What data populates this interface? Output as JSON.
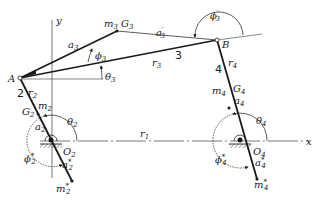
{
  "diagram": {
    "axes": {
      "x_label": "x",
      "y_label": "y"
    },
    "points": {
      "A": "A",
      "B": "B",
      "O2": {
        "base": "O",
        "sub": "2"
      },
      "O4": {
        "base": "O",
        "sub": "4"
      },
      "G2": {
        "base": "G",
        "sub": "2"
      },
      "G3": {
        "base": "G",
        "sub": "3"
      },
      "G4": {
        "base": "G",
        "sub": "4"
      }
    },
    "links": {
      "link2_number": "2",
      "link3_number": "3",
      "link4_number": "4"
    },
    "lengths": {
      "r1": {
        "base": "r",
        "sub": "1"
      },
      "r2": {
        "base": "r",
        "sub": "2"
      },
      "r3": {
        "base": "r",
        "sub": "3"
      },
      "r4": {
        "base": "r",
        "sub": "4"
      },
      "a2": {
        "base": "a",
        "sub": "2"
      },
      "a3": {
        "base": "a",
        "sub": "3"
      },
      "a3p": {
        "base": "a",
        "sub": "3",
        "sup": "′"
      },
      "a4": {
        "base": "a",
        "sub": "4"
      },
      "a2s": {
        "base": "a",
        "sub": "2",
        "sup": "*"
      },
      "a4s": {
        "base": "a",
        "sub": "4",
        "sup": "*"
      }
    },
    "masses": {
      "m2": {
        "base": "m",
        "sub": "2"
      },
      "m3": {
        "base": "m",
        "sub": "3"
      },
      "m4": {
        "base": "m",
        "sub": "4"
      },
      "m2s": {
        "base": "m",
        "sub": "2",
        "sup": "*"
      },
      "m4s": {
        "base": "m",
        "sub": "4",
        "sup": "*"
      }
    },
    "angles": {
      "theta2": {
        "base": "θ",
        "sub": "2"
      },
      "theta3": {
        "base": "θ",
        "sub": "3"
      },
      "theta4": {
        "base": "θ",
        "sub": "4"
      },
      "phi2s": {
        "base": "ϕ",
        "sub": "2",
        "sup": "*"
      },
      "phi3": {
        "base": "ϕ",
        "sub": "3"
      },
      "phi3p": {
        "base": "ϕ",
        "sub": "3",
        "sup": "′"
      },
      "phi4s": {
        "base": "ϕ",
        "sub": "4",
        "sup": "*"
      }
    },
    "colors": {
      "ink": "#1a1a1a",
      "background": "#ffffff"
    }
  }
}
